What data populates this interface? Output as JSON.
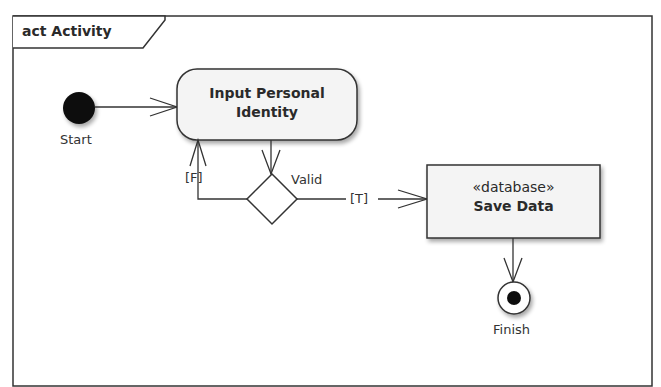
{
  "frame": {
    "title": "act Activity"
  },
  "nodes": {
    "start": {
      "label": "Start"
    },
    "input_action": {
      "line1": "Input Personal",
      "line2": "Identity"
    },
    "decision": {
      "label": "Valid"
    },
    "save_action": {
      "stereotype": "«database»",
      "name": "Save Data"
    },
    "finish": {
      "label": "Finish"
    }
  },
  "edges": {
    "false_guard": "[F]",
    "true_guard": "[T]"
  },
  "colors": {
    "line": "#333333",
    "node_fill": "#f4f4f4",
    "shadow": "#c8c8c8"
  }
}
